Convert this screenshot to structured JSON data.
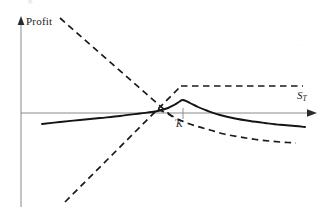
{
  "figure": {
    "background": "#ffffff",
    "ink": "#1a1a1a",
    "axis_color": "#808080"
  },
  "labels": {
    "y_axis": "Profit",
    "x_axis_symbol": "S",
    "x_axis_subscript": "T",
    "strike_marker": "K",
    "artifact_left": "g",
    "artifact_right": "."
  },
  "chart_data": {
    "type": "line",
    "title": "",
    "xlabel": "S_T",
    "ylabel": "Profit",
    "grid": false,
    "legend": null,
    "axes": {
      "x_axis_y_pixel": 113,
      "y_axis_x_pixel": 21,
      "x_arrow_tip_x": 316,
      "y_arrow_tip_y": 18,
      "zero_line": true
    },
    "annotations": [
      {
        "text": "Profit",
        "x": 26,
        "y": 22,
        "role": "y-axis-label"
      },
      {
        "text": "S_T",
        "x": 300,
        "y": 96,
        "role": "x-axis-label"
      },
      {
        "text": "K",
        "x": 180,
        "y": 126,
        "role": "strike-price-marker"
      }
    ],
    "strike_tick": {
      "x": 183,
      "y_top": 108,
      "y_bottom": 119
    },
    "series": [
      {
        "name": "covered-call-profit",
        "style": "solid",
        "color": "#1a1a1a",
        "points": [
          [
            42,
            124
          ],
          [
            60,
            122
          ],
          [
            80,
            120
          ],
          [
            100,
            118
          ],
          [
            120,
            116
          ],
          [
            140,
            113.5
          ],
          [
            152,
            112
          ],
          [
            160,
            110.5
          ],
          [
            168,
            108
          ],
          [
            174,
            105
          ],
          [
            179,
            102
          ],
          [
            183,
            100
          ],
          [
            190,
            103
          ],
          [
            198,
            107
          ],
          [
            208,
            111
          ],
          [
            220,
            115
          ],
          [
            235,
            118.5
          ],
          [
            250,
            121
          ],
          [
            265,
            123
          ],
          [
            280,
            124.8
          ],
          [
            295,
            126
          ],
          [
            305,
            127
          ]
        ]
      },
      {
        "name": "long-stock-payoff",
        "style": "dashed",
        "color": "#1a1a1a",
        "points": [
          [
            65,
            202
          ],
          [
            181,
            86
          ]
        ]
      },
      {
        "name": "short-stock-payoff",
        "style": "dashed",
        "color": "#1a1a1a",
        "points": [
          [
            60,
            18
          ],
          [
            176,
            120
          ]
        ]
      },
      {
        "name": "capped-payoff",
        "style": "dashed",
        "color": "#1a1a1a",
        "points": [
          [
            181,
            86
          ],
          [
            303,
            86
          ]
        ]
      },
      {
        "name": "declining-dashed-curve",
        "style": "dashed",
        "color": "#1a1a1a",
        "points": [
          [
            158,
            109
          ],
          [
            170,
            115
          ],
          [
            182,
            121
          ],
          [
            196,
            126
          ],
          [
            210,
            130
          ],
          [
            224,
            134
          ],
          [
            240,
            137
          ],
          [
            256,
            139.5
          ],
          [
            272,
            141.3
          ],
          [
            286,
            142.4
          ],
          [
            296,
            143
          ]
        ]
      }
    ]
  }
}
